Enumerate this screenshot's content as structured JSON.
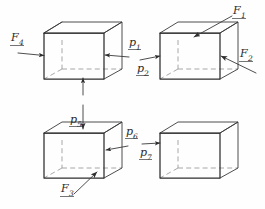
{
  "figure": {
    "background_color": "#fefefe",
    "line_color": "#3a3a3a",
    "hidden_edge_color": "#8c8c8c",
    "label_color": "#2b2b2b"
  },
  "boxes": [
    {
      "id": "box-1",
      "position": "top-left",
      "label": ""
    },
    {
      "id": "box-2",
      "position": "top-right",
      "label": ""
    },
    {
      "id": "box-3",
      "position": "bottom-left",
      "label": ""
    },
    {
      "id": "box-4",
      "position": "bottom-right",
      "label": ""
    }
  ],
  "labels": {
    "f1": {
      "symbol": "F",
      "subscript": "1",
      "text": "F1",
      "kind": "force",
      "box": "box-2",
      "direction": "down-left onto top face"
    },
    "f2": {
      "symbol": "F",
      "subscript": "2",
      "text": "F2",
      "kind": "force",
      "box": "box-2",
      "direction": "up-left into right face"
    },
    "f3": {
      "symbol": "F",
      "subscript": "3",
      "text": "F3",
      "kind": "force",
      "box": "box-3",
      "direction": "up-right into bottom front edge"
    },
    "f4": {
      "symbol": "F",
      "subscript": "4",
      "text": "F4",
      "kind": "force",
      "box": "box-1",
      "direction": "right into left face"
    },
    "p1": {
      "symbol": "p",
      "subscript": "1",
      "text": "p1",
      "kind": "pressure",
      "box": "box-1",
      "direction": "left into right face"
    },
    "p2": {
      "symbol": "p",
      "subscript": "2",
      "text": "p2",
      "kind": "pressure",
      "box": "box-2",
      "direction": "right into left face"
    },
    "p5": {
      "symbol": "p",
      "subscript": "5",
      "text": "p5",
      "kind": "pressure",
      "box": "box-3",
      "direction": "down onto top face"
    },
    "p6": {
      "symbol": "p",
      "subscript": "6",
      "text": "p6",
      "kind": "pressure",
      "box": "box-3",
      "direction": "left into right face"
    },
    "p7": {
      "symbol": "p",
      "subscript": "7",
      "text": "p7",
      "kind": "pressure",
      "box": "box-4",
      "direction": "right into left face"
    }
  }
}
